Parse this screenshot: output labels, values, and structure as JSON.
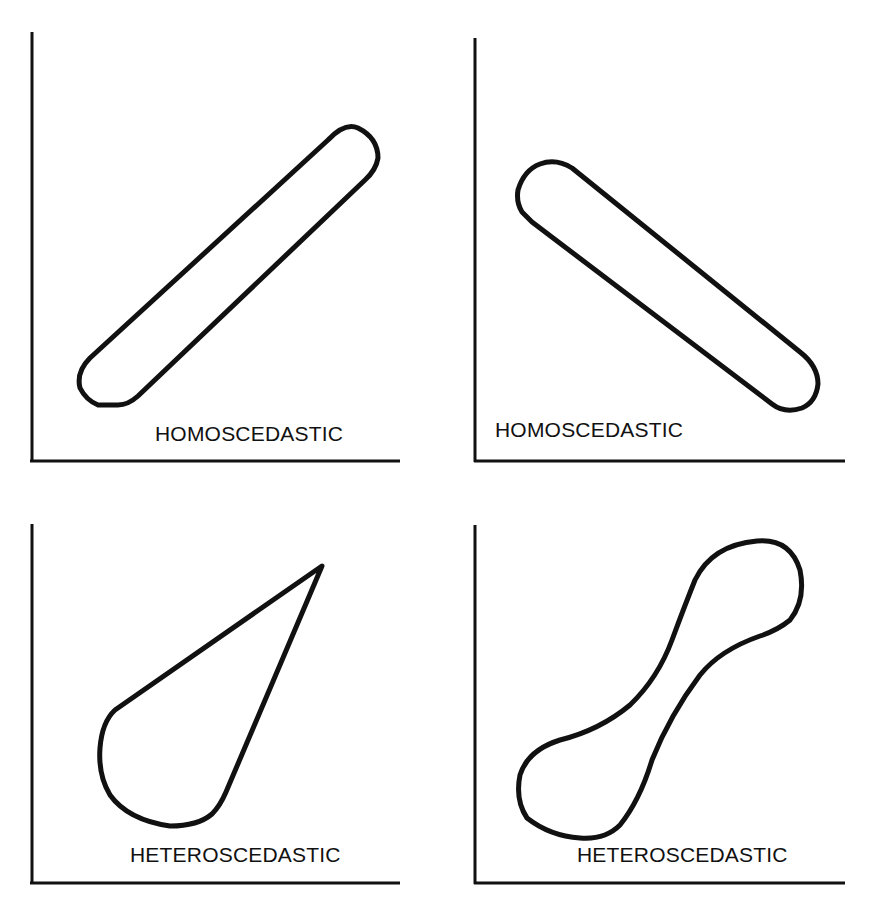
{
  "panels": [
    {
      "id": "top-left",
      "label": "HOMOSCEDASTIC",
      "shape": "diagonal capsule, positive slope"
    },
    {
      "id": "top-right",
      "label": "HOMOSCEDASTIC",
      "shape": "diagonal capsule, negative slope"
    },
    {
      "id": "bottom-left",
      "label": "HETEROSCEDASTIC",
      "shape": "teardrop widening toward lower-left"
    },
    {
      "id": "bottom-right",
      "label": "HETEROSCEDASTIC",
      "shape": "dumbbell / bone shape, positive slope"
    }
  ],
  "colors": {
    "ink": "#111111",
    "background": "#ffffff"
  }
}
